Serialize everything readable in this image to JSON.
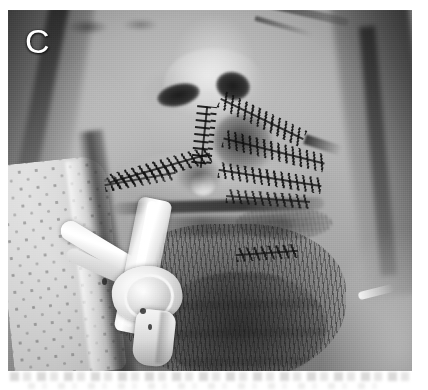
{
  "figure": {
    "domain": "medical-clinical-photograph",
    "panel_label": "C",
    "modality": "color-photograph-reproduced-grayscale",
    "orientation": "frontal",
    "anatomy": "lower face: nose, upper lip, lower lip, chin, bilateral cheeks",
    "background_color": "#ffffff",
    "photo_bounds": {
      "x": 8,
      "y": 10,
      "width": 404,
      "height": 361
    },
    "tone": {
      "darkest": "#1e1c1a",
      "shadow": "#403d3a",
      "midtone": "#8d8a85",
      "skin": "#b6b2ac",
      "highlight": "#e7e5e1",
      "brightest": "#ffffff"
    }
  },
  "visible_content": {
    "subject": "adult patient face, lower two-thirds",
    "features": [
      {
        "name": "nose",
        "note": "nasal tip and both nostrils visible, centered upper frame"
      },
      {
        "name": "nostril-left",
        "note": "dark elliptical aperture, patient right of frame center-left"
      },
      {
        "name": "nostril-right",
        "note": "dark elliptical aperture, frame right of columella"
      },
      {
        "name": "upper-lip",
        "note": "swollen, traversed by sutured laceration"
      },
      {
        "name": "lower-lip",
        "note": "partially obscured by indwelling tube"
      },
      {
        "name": "chin",
        "note": "heavy dark beard stubble"
      },
      {
        "name": "beard-stubble",
        "note": "dense dark stubble over chin and lower cheeks"
      }
    ],
    "findings": [
      {
        "name": "suture-line-left-cheek",
        "note": "oblique running suture across left upper lip and cheek"
      },
      {
        "name": "suture-line-philtrum",
        "note": "vertical suture line through philtral column"
      },
      {
        "name": "suture-line-right-cheek-upper",
        "note": "dense cluster of sutures lateral to right nasal ala"
      },
      {
        "name": "suture-line-right-cheek-mid",
        "note": "oblique suture line across right upper lip"
      },
      {
        "name": "suture-line-right-cheek-lower",
        "note": "suture line continuing toward right oral commissure"
      },
      {
        "name": "suture-line-chin",
        "note": "short suture segment on right chin"
      },
      {
        "name": "wound-crusting",
        "note": "dark crusted blood along repaired laceration margins"
      }
    ],
    "devices": [
      {
        "name": "orotracheal-tube",
        "note": "white tube exiting the mouth, angled toward frame lower-left"
      },
      {
        "name": "tube-connector-hub",
        "note": "bright white connector / fixation assembly at lower left of mouth"
      },
      {
        "name": "tube-side-branch",
        "note": "secondary white limb running up-left from the hub"
      },
      {
        "name": "adhesive-tape-strand",
        "note": "thin white strand on right cheek near frame edge"
      }
    ],
    "surroundings": [
      {
        "name": "surgical-drape",
        "note": "perforated white fabric with regular dot pattern, left of face"
      },
      {
        "name": "shadow-gutter",
        "note": "dark band separating drape from cheek"
      },
      {
        "name": "hair-shadow-right",
        "note": "dark band along right frame edge"
      },
      {
        "name": "dark-line-upper-right",
        "note": "dark curved line crossing upper right of frame"
      }
    ]
  },
  "caption": {
    "visible": false,
    "note": "a faint illegible line of printed text is partially cropped at the bottom white margin"
  }
}
